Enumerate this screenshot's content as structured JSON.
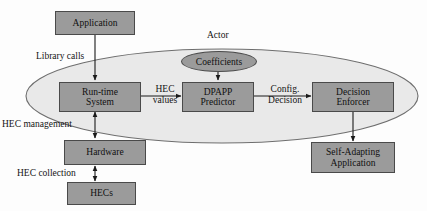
{
  "diagram": {
    "colors": {
      "node_fill": "#9b9b9b",
      "node_stroke": "#4a4a4a",
      "boundary_fill": "#e9e9e9",
      "boundary_stroke": "#6e6e6e",
      "arrow": "#1a1a1a",
      "text": "#141414",
      "background": "#fdfdfd"
    },
    "boundary": {
      "label": "Actor",
      "shape": "ellipse"
    },
    "nodes": {
      "application": {
        "line1": "Application"
      },
      "runtime_system": {
        "line1": "Run-time",
        "line2": "System"
      },
      "coefficients": {
        "line1": "Coefficients"
      },
      "dpapp_predictor": {
        "line1": "DPAPP",
        "line2": "Predictor"
      },
      "decision_enforcer": {
        "line1": "Decision",
        "line2": "Enforcer"
      },
      "self_adapting_application": {
        "line1": "Self-Adapting",
        "line2": "Application"
      },
      "hardware": {
        "line1": "Hardware"
      },
      "hecs": {
        "line1": "HECs"
      }
    },
    "edge_labels": {
      "library_calls": {
        "line1": "Library calls"
      },
      "hec_values": {
        "line1": "HEC",
        "line2": "values"
      },
      "config_decision": {
        "line1": "Config.",
        "line2": "Decision"
      },
      "hec_management": {
        "line1": "HEC management"
      },
      "hec_collection": {
        "line1": "HEC collection"
      }
    }
  }
}
